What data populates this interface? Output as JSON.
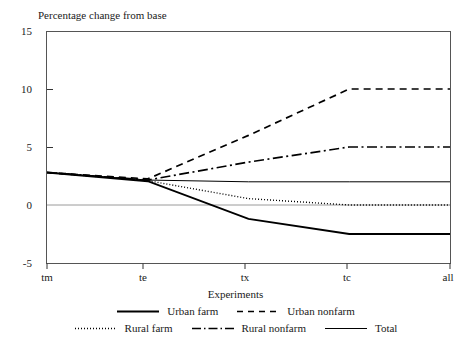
{
  "chart_data": {
    "type": "line",
    "title": "",
    "ylabel": "Percentage change from base",
    "xlabel": "Experiments",
    "categories": [
      "tm",
      "te",
      "tx",
      "tc",
      "all"
    ],
    "x": [
      0,
      1,
      2,
      3,
      4
    ],
    "ylim": [
      -5,
      15
    ],
    "yticks": [
      15,
      10,
      5,
      0,
      -5
    ],
    "grid": "zero-line-only",
    "legend_position": "bottom",
    "series": [
      {
        "name": "Urban farm",
        "style": "solid-thick",
        "values": [
          2.8,
          2.05,
          -1.2,
          -2.5,
          -2.5
        ]
      },
      {
        "name": "Urban nonfarm",
        "style": "dashed",
        "values": [
          2.8,
          2.25,
          6.0,
          10.0,
          10.0
        ]
      },
      {
        "name": "Rural farm",
        "style": "dotted",
        "values": [
          2.8,
          2.1,
          0.55,
          0.0,
          0.0
        ]
      },
      {
        "name": "Rural nonfarm",
        "style": "dash-dot",
        "values": [
          2.8,
          2.15,
          3.7,
          5.0,
          5.0
        ]
      },
      {
        "name": "Total",
        "style": "solid-thin",
        "values": [
          2.8,
          2.15,
          2.0,
          2.0,
          2.0
        ]
      }
    ]
  },
  "axes": {
    "y_labels": [
      "15",
      "10",
      "5",
      "0",
      "-5"
    ],
    "x_labels": [
      "tm",
      "te",
      "tx",
      "tc",
      "all"
    ],
    "y_title": "Percentage change from base",
    "x_title": "Experiments"
  },
  "legend": {
    "row1": [
      {
        "label": "Urban farm",
        "style": "solid-thick"
      },
      {
        "label": "Urban nonfarm",
        "style": "dashed"
      }
    ],
    "row2": [
      {
        "label": "Rural farm",
        "style": "dotted"
      },
      {
        "label": "Rural nonfarm",
        "style": "dash-dot"
      },
      {
        "label": "Total",
        "style": "solid-thin"
      }
    ]
  },
  "colors": {
    "line": "#000000",
    "frame": "#555555",
    "zero_grid": "#9a9a9a",
    "text": "#1a1a1a",
    "background": "#ffffff"
  }
}
